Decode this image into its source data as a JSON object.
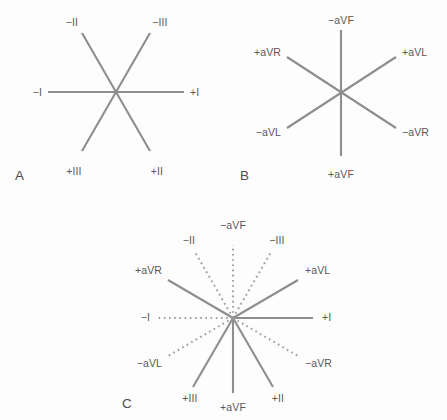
{
  "figure": {
    "background_color": "#fdfdfd",
    "line_color": "#8e8e8e",
    "dotted_line_color": "#9e9e9e",
    "label_color": "#58585a",
    "panel_letter_color": "#4d4d4f"
  },
  "panels": [
    {
      "id": "A",
      "letter": "A",
      "letter_pos": {
        "x": 15,
        "y": 168
      },
      "center": {
        "x": 116,
        "y": 92
      },
      "description": "Standard limb leads I, II and III axes",
      "axes": [
        {
          "name": "lead-I",
          "style": "solid",
          "angle_deg": 0,
          "x1": 48,
          "y1": 92,
          "x2": 184,
          "y2": 92,
          "labels": [
            {
              "text": "−I",
              "x": 42,
              "y": 92,
              "align": "right"
            },
            {
              "text": "+I",
              "x": 190,
              "y": 92,
              "align": "left"
            }
          ]
        },
        {
          "name": "lead-II",
          "style": "solid",
          "angle_deg": 60,
          "x1": 82,
          "y1": 33,
          "x2": 150,
          "y2": 151,
          "labels": [
            {
              "text": "−II",
              "x": 72,
              "y": 22,
              "align": "center"
            },
            {
              "text": "+II",
              "x": 157,
              "y": 171,
              "align": "center"
            }
          ]
        },
        {
          "name": "lead-III",
          "style": "solid",
          "angle_deg": 120,
          "x1": 150,
          "y1": 33,
          "x2": 82,
          "y2": 151,
          "labels": [
            {
              "text": "−III",
              "x": 160,
              "y": 22,
              "align": "center"
            },
            {
              "text": "+III",
              "x": 74,
              "y": 171,
              "align": "center"
            }
          ]
        }
      ]
    },
    {
      "id": "B",
      "letter": "B",
      "letter_pos": {
        "x": 240,
        "y": 168
      },
      "center": {
        "x": 341,
        "y": 92
      },
      "description": "Augmented limb leads aVR, aVL and aVF axes",
      "axes": [
        {
          "name": "lead-aVF",
          "style": "solid",
          "angle_deg": 90,
          "x1": 341,
          "y1": 30,
          "x2": 341,
          "y2": 156,
          "labels": [
            {
              "text": "−aVF",
              "x": 341,
              "y": 20,
              "align": "center"
            },
            {
              "text": "+aVF",
              "x": 341,
              "y": 174,
              "align": "center"
            }
          ]
        },
        {
          "name": "lead-aVR",
          "style": "solid",
          "angle_deg": 30,
          "x1": 287,
          "y1": 57,
          "x2": 396,
          "y2": 128,
          "labels": [
            {
              "text": "+aVR",
              "x": 281,
              "y": 52,
              "align": "right"
            },
            {
              "text": "−aVR",
              "x": 402,
              "y": 132,
              "align": "left"
            }
          ]
        },
        {
          "name": "lead-aVL",
          "style": "solid",
          "angle_deg": 150,
          "x1": 396,
          "y1": 57,
          "x2": 287,
          "y2": 128,
          "labels": [
            {
              "text": "+aVL",
              "x": 402,
              "y": 52,
              "align": "left"
            },
            {
              "text": "−aVL",
              "x": 281,
              "y": 132,
              "align": "right"
            }
          ]
        }
      ]
    },
    {
      "id": "C",
      "letter": "C",
      "letter_pos": {
        "x": 122,
        "y": 396
      },
      "center": {
        "x": 233,
        "y": 318
      },
      "description": "Complete hexaxial reference system; positive axes solid, negative axes dotted",
      "axes": [
        {
          "name": "lead-I-positive",
          "style": "solid",
          "angle_deg": 0,
          "x1": 233,
          "y1": 318,
          "x2": 313,
          "y2": 318,
          "labels": [
            {
              "text": "+I",
              "x": 322,
              "y": 317,
              "align": "left"
            }
          ]
        },
        {
          "name": "lead-I-negative",
          "style": "dotted",
          "angle_deg": 180,
          "x1": 233,
          "y1": 318,
          "x2": 158,
          "y2": 318,
          "labels": [
            {
              "text": "−I",
              "x": 150,
              "y": 317,
              "align": "right"
            }
          ]
        },
        {
          "name": "lead-II-positive",
          "style": "solid",
          "angle_deg": 60,
          "x1": 233,
          "y1": 318,
          "x2": 273,
          "y2": 387,
          "labels": [
            {
              "text": "+II",
              "x": 278,
              "y": 398,
              "align": "center"
            }
          ]
        },
        {
          "name": "lead-II-negative",
          "style": "dotted",
          "angle_deg": 240,
          "x1": 233,
          "y1": 318,
          "x2": 195,
          "y2": 252,
          "labels": [
            {
              "text": "−II",
              "x": 189,
              "y": 240,
              "align": "center"
            }
          ]
        },
        {
          "name": "lead-III-positive",
          "style": "solid",
          "angle_deg": 120,
          "x1": 233,
          "y1": 318,
          "x2": 193,
          "y2": 387,
          "labels": [
            {
              "text": "+III",
              "x": 190,
              "y": 398,
              "align": "center"
            }
          ]
        },
        {
          "name": "lead-III-negative",
          "style": "dotted",
          "angle_deg": 300,
          "x1": 233,
          "y1": 318,
          "x2": 271,
          "y2": 252,
          "labels": [
            {
              "text": "−III",
              "x": 277,
              "y": 240,
              "align": "center"
            }
          ]
        },
        {
          "name": "lead-aVF-positive",
          "style": "solid",
          "angle_deg": 90,
          "x1": 233,
          "y1": 318,
          "x2": 233,
          "y2": 393,
          "labels": [
            {
              "text": "+aVF",
              "x": 233,
              "y": 407,
              "align": "center"
            }
          ]
        },
        {
          "name": "lead-aVF-negative",
          "style": "dotted",
          "angle_deg": 270,
          "x1": 233,
          "y1": 318,
          "x2": 233,
          "y2": 245,
          "labels": [
            {
              "text": "−aVF",
              "x": 233,
              "y": 225,
              "align": "center"
            }
          ]
        },
        {
          "name": "lead-aVR-positive",
          "style": "solid",
          "angle_deg": 210,
          "x1": 233,
          "y1": 318,
          "x2": 168,
          "y2": 280,
          "labels": [
            {
              "text": "+aVR",
              "x": 162,
              "y": 270,
              "align": "right"
            }
          ]
        },
        {
          "name": "lead-aVR-negative",
          "style": "dotted",
          "angle_deg": 30,
          "x1": 233,
          "y1": 318,
          "x2": 298,
          "y2": 356,
          "labels": [
            {
              "text": "−aVR",
              "x": 305,
              "y": 363,
              "align": "left"
            }
          ]
        },
        {
          "name": "lead-aVL-positive",
          "style": "solid",
          "angle_deg": 330,
          "x1": 233,
          "y1": 318,
          "x2": 298,
          "y2": 280,
          "labels": [
            {
              "text": "+aVL",
              "x": 305,
              "y": 270,
              "align": "left"
            }
          ]
        },
        {
          "name": "lead-aVL-negative",
          "style": "dotted",
          "angle_deg": 150,
          "x1": 233,
          "y1": 318,
          "x2": 168,
          "y2": 356,
          "labels": [
            {
              "text": "−aVL",
              "x": 162,
              "y": 363,
              "align": "right"
            }
          ]
        }
      ]
    }
  ]
}
